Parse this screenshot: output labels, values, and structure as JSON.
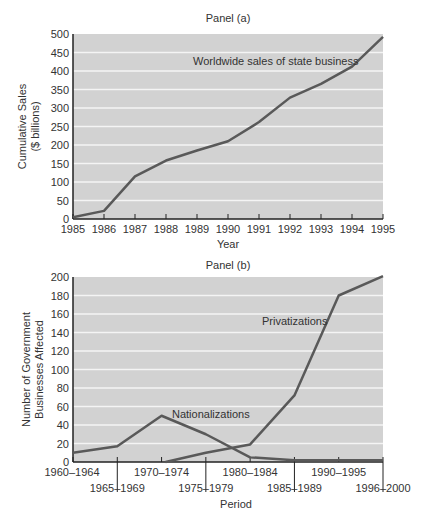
{
  "chart_data": [
    {
      "type": "line",
      "title": "Panel (a)",
      "xlabel": "Year",
      "ylabel": "Cumulative Sales ($ billions)",
      "ylabel_lines": [
        "Cumulative Sales",
        "($ billions)"
      ],
      "x": [
        1985,
        1986,
        1987,
        1988,
        1989,
        1990,
        1991,
        1992,
        1993,
        1994,
        1995
      ],
      "series": [
        {
          "name": "Worldwide sales of state business",
          "values": [
            5,
            22,
            115,
            158,
            185,
            210,
            262,
            328,
            365,
            412,
            492
          ]
        }
      ],
      "ylim": [
        0,
        500
      ],
      "yticks": [
        0,
        50,
        100,
        150,
        200,
        250,
        300,
        350,
        400,
        450,
        500
      ],
      "grid": true,
      "annotation": "Worldwide sales of state business"
    },
    {
      "type": "line",
      "title": "Panel (b)",
      "xlabel": "Period",
      "ylabel": "Number of Government Businesses Affected",
      "ylabel_lines": [
        "Number of Government",
        "Businesses Affected"
      ],
      "categories": [
        "1960–1964",
        "1965–1969",
        "1970–1974",
        "1975–1979",
        "1980–1984",
        "1985–1989",
        "1990–1995",
        "1996–2000"
      ],
      "series": [
        {
          "name": "Nationalizations",
          "values": [
            10,
            17,
            50,
            30,
            5,
            2,
            2,
            2
          ]
        },
        {
          "name": "Privatizations",
          "values": [
            null,
            null,
            0,
            10,
            19,
            72,
            180,
            201
          ]
        }
      ],
      "ylim": [
        0,
        200
      ],
      "yticks": [
        0,
        20,
        40,
        60,
        80,
        100,
        120,
        140,
        160,
        180,
        200
      ],
      "grid": true,
      "annotations": [
        "Privatizations",
        "Nationalizations"
      ]
    }
  ],
  "colors": {
    "plot_bg": "#d2d2d2",
    "grid": "#f4f4f4",
    "line": "#595959",
    "axis": "#222222"
  }
}
